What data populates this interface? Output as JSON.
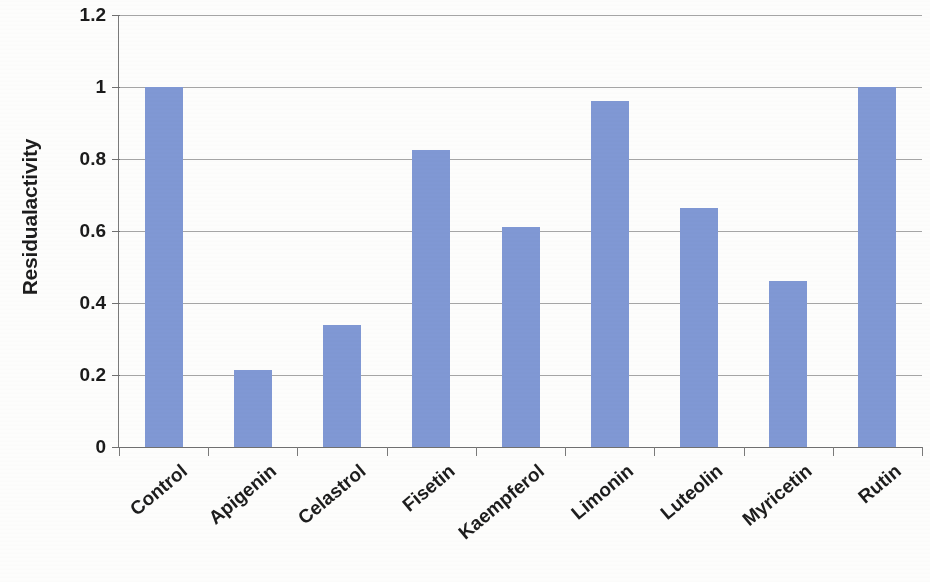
{
  "chart_data": {
    "type": "bar",
    "title": "",
    "xlabel": "",
    "ylabel": "Residualactivity",
    "categories": [
      "Control",
      "Apigenin",
      "Celastrol",
      "Fisetin",
      "Kaempferol",
      "Limonin",
      "Luteolin",
      "Myricetin",
      "Rutin"
    ],
    "values": [
      1.0,
      0.215,
      0.34,
      0.825,
      0.61,
      0.96,
      0.665,
      0.46,
      1.0
    ],
    "ylim": [
      0,
      1.2
    ],
    "ytick_labels": [
      "0",
      "0.2",
      "0.4",
      "0.6",
      "0.8",
      "1",
      "1.2"
    ],
    "ytick_values": [
      0,
      0.2,
      0.4,
      0.6,
      0.8,
      1,
      1.2
    ],
    "grid": true,
    "legend": "none",
    "series_color": "#8098D4",
    "axis_color": "#7A7A7A",
    "gridline_color": "#8C8C8C",
    "text_color": "#1D1D1D",
    "category_label_rotation_deg": -40
  }
}
